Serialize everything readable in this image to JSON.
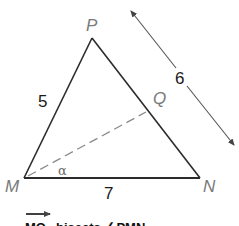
{
  "diagram": {
    "vertices": {
      "P": {
        "label": "P",
        "x": 92,
        "y": 38
      },
      "M": {
        "label": "M",
        "x": 24,
        "y": 178
      },
      "N": {
        "label": "N",
        "x": 200,
        "y": 178
      },
      "Q": {
        "label": "Q",
        "x": 146,
        "y": 112
      }
    },
    "side_labels": {
      "MP": "5",
      "MN": "7",
      "PN": "6"
    },
    "angle_label": "α",
    "bisector": "MQ",
    "caption": {
      "ray": "MQ",
      "text": "bisects ∠PMN"
    },
    "colors": {
      "line": "#2b2b2b",
      "dashed": "#8a8a8a",
      "arrow": "#555555",
      "vertex_label": "#7a7a7a"
    }
  }
}
